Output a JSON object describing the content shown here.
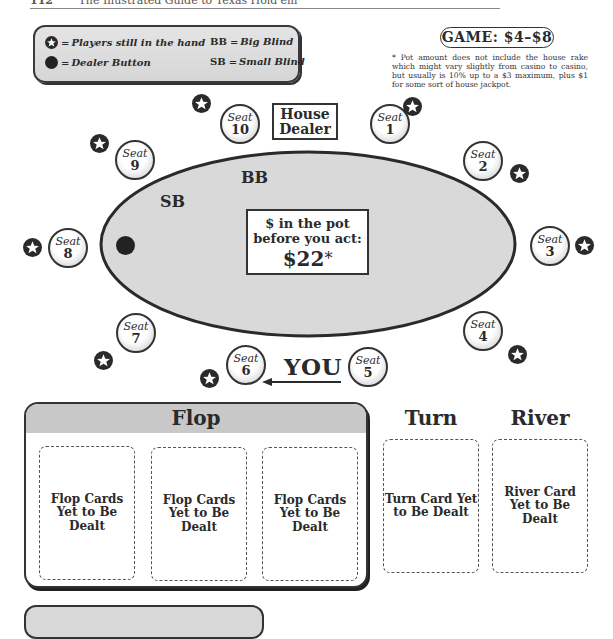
{
  "page_header": {
    "page_number": "112",
    "running_title": "The Illustrated Guide to Texas Hold'em"
  },
  "legend": {
    "items": [
      {
        "icon": "star-icon",
        "text": "Players still in the hand"
      },
      {
        "icon": "dealer-button-icon",
        "text": "Dealer Button"
      }
    ],
    "abbreviations": [
      {
        "abbr": "BB",
        "text": "Big Blind"
      },
      {
        "abbr": "SB",
        "text": "Small Blind"
      }
    ],
    "eq": "="
  },
  "game": {
    "label": "GAME: $4–$8"
  },
  "footnote": "* Pot amount does not include the house rake which might vary slightly from casino to casino, but usually is 10% up to a $3 maximum, plus $1 for some sort of house jackpot.",
  "table": {
    "house_dealer": [
      "House",
      "Dealer"
    ],
    "bb_label": "BB",
    "sb_label": "SB",
    "pot": {
      "line1": "$ in the pot",
      "line2": "before you act:",
      "amount": "$22",
      "asterisk": "*"
    },
    "you_label": "YOU",
    "seat_word": "Seat",
    "seats": [
      {
        "number": "1",
        "in_hand": true
      },
      {
        "number": "2",
        "in_hand": true
      },
      {
        "number": "3",
        "in_hand": true
      },
      {
        "number": "4",
        "in_hand": true
      },
      {
        "number": "5",
        "in_hand": false,
        "is_you": true
      },
      {
        "number": "6",
        "in_hand": true
      },
      {
        "number": "7",
        "in_hand": true
      },
      {
        "number": "8",
        "in_hand": true,
        "dealer_button": true
      },
      {
        "number": "9",
        "in_hand": true
      },
      {
        "number": "10",
        "in_hand": true
      }
    ],
    "colors": {
      "felt": "#d9d9d9",
      "outline": "#2a2a2a",
      "star_bg": "#2a2a2a"
    }
  },
  "board": {
    "flop": {
      "title": "Flop",
      "cards": [
        "Flop Cards Yet to Be Dealt",
        "Flop Cards Yet to Be Dealt",
        "Flop Cards Yet to Be Dealt"
      ]
    },
    "turn": {
      "title": "Turn",
      "card": "Turn Card Yet to Be Dealt"
    },
    "river": {
      "title": "River",
      "card": "River Card Yet to Be Dealt"
    }
  }
}
